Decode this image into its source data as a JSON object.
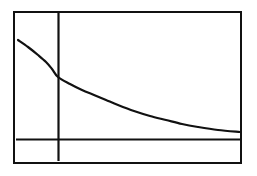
{
  "figure": {
    "name": "exponential-decay-graph",
    "background_color": "#ffffff",
    "ink_color": "#111111",
    "frame": {
      "label": "graph viewport border",
      "left": 13,
      "top": 11,
      "width": 229,
      "height": 153,
      "border_width": 2
    }
  },
  "chart_data": {
    "type": "line",
    "title": "",
    "subtitle": "",
    "xlabel": "",
    "ylabel": "",
    "grid": false,
    "legend": [],
    "legend_position": "none",
    "axis_style": "crosshair-through-origin",
    "tick_labels_x": [],
    "tick_labels_y": [],
    "xlim": [
      -2,
      9
    ],
    "ylim": [
      -0.6,
      4.2
    ],
    "origin_pixel": {
      "x": 58,
      "y": 139
    },
    "x_axis_pixel": {
      "y": 139,
      "x_start": 16,
      "x_end": 241
    },
    "y_axis_pixel": {
      "x": 58,
      "y_start": 13,
      "y_end": 161
    },
    "annotations": [],
    "series": [
      {
        "name": "decay curve",
        "description": "decreasing convex curve approaching the x-axis asymptotically from above",
        "equation_form": "y = a*b^x, 0 < b < 1",
        "color": "#111111",
        "x": [
          -2.0,
          -1.6,
          -1.2,
          -0.8,
          -0.4,
          0.0,
          0.6,
          1.2,
          1.8,
          2.4,
          3.0,
          3.8,
          4.6,
          5.4,
          6.2,
          7.0,
          8.0,
          9.0
        ],
        "y": [
          3.2,
          2.96,
          2.72,
          2.5,
          2.3,
          2.1,
          1.82,
          1.58,
          1.38,
          1.2,
          1.05,
          0.88,
          0.74,
          0.63,
          0.54,
          0.47,
          0.4,
          0.35
        ],
        "pixel_points": [
          [
            18,
            40
          ],
          [
            28,
            47
          ],
          [
            38,
            55
          ],
          [
            46,
            62
          ],
          [
            52,
            69
          ],
          [
            58,
            77
          ],
          [
            70,
            84
          ],
          [
            82,
            90
          ],
          [
            94,
            95
          ],
          [
            106,
            100
          ],
          [
            118,
            105
          ],
          [
            134,
            111
          ],
          [
            150,
            116
          ],
          [
            166,
            120
          ],
          [
            182,
            124
          ],
          [
            198,
            127
          ],
          [
            218,
            130
          ],
          [
            240,
            132
          ]
        ]
      }
    ]
  }
}
